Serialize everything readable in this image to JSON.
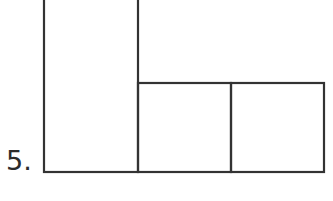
{
  "problem": {
    "number_label": "5."
  },
  "figure": {
    "stroke_color": "#333333",
    "shapes": [
      {
        "name": "tall-rectangle",
        "x": 44,
        "y": -4,
        "width": 94,
        "height": 176
      },
      {
        "name": "middle-square",
        "x": 138,
        "y": 83,
        "width": 93,
        "height": 89
      },
      {
        "name": "right-square",
        "x": 231,
        "y": 83,
        "width": 93,
        "height": 89
      }
    ]
  }
}
